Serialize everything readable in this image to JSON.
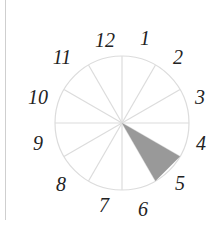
{
  "diagram": {
    "type": "clock-face",
    "center": [
      122,
      123
    ],
    "radius": 67,
    "line_color": "#dcdcdc",
    "wedge_color": "#999999",
    "shaded_sector": {
      "from_hour": 4,
      "to_hour": 5
    },
    "labels": [
      {
        "text": "12",
        "x": 105,
        "y": 47
      },
      {
        "text": "1",
        "x": 145,
        "y": 45
      },
      {
        "text": "2",
        "x": 178,
        "y": 64
      },
      {
        "text": "3",
        "x": 200,
        "y": 104
      },
      {
        "text": "4",
        "x": 201,
        "y": 150
      },
      {
        "text": "5",
        "x": 180,
        "y": 190
      },
      {
        "text": "6",
        "x": 143,
        "y": 216
      },
      {
        "text": "7",
        "x": 104,
        "y": 212
      },
      {
        "text": "8",
        "x": 61,
        "y": 191
      },
      {
        "text": "9",
        "x": 38,
        "y": 150
      },
      {
        "text": "10",
        "x": 38,
        "y": 104
      },
      {
        "text": "11",
        "x": 62,
        "y": 64
      }
    ]
  }
}
